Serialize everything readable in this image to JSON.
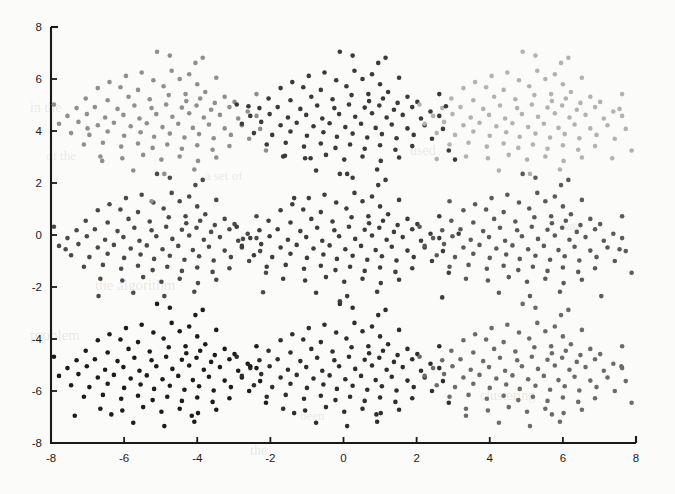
{
  "figure": {
    "width": 675,
    "height": 494,
    "background_color": "#fbfbf9",
    "axis_color": "#1a1a1a"
  },
  "chart_data": {
    "type": "scatter",
    "title": "",
    "xlabel": "",
    "ylabel": "",
    "xlim": [
      -8,
      8
    ],
    "ylim": [
      -8,
      8
    ],
    "xticks": [
      -8,
      -6,
      -4,
      -2,
      0,
      2,
      4,
      6,
      8
    ],
    "yticks": [
      -8,
      -6,
      -4,
      -2,
      0,
      2,
      4,
      6,
      8
    ],
    "xtick_labels": [
      "-8",
      "-6",
      "-4",
      "-2",
      "0",
      "2",
      "4",
      "6",
      "8"
    ],
    "ytick_labels": [
      "-8",
      "-6",
      "-4",
      "-2",
      "0",
      "2",
      "4",
      "6",
      "8"
    ],
    "grid": false,
    "legend": null,
    "marker": "filled-circle",
    "marker_size_px": 4.6,
    "n_clusters": 9,
    "points_per_cluster": 100,
    "total_points": 900,
    "cluster_grid": {
      "centers_x": [
        -5.0,
        0.0,
        5.0
      ],
      "centers_y": [
        4.7,
        0.0,
        -5.0
      ],
      "note": "3x3 grid of identical translated Gaussian-like blobs"
    },
    "clusters": [
      {
        "id": "top-left",
        "center": [
          -5.0,
          4.7
        ],
        "color": "#8f8f8f",
        "n": 100
      },
      {
        "id": "top-middle",
        "center": [
          0.0,
          4.7
        ],
        "color": "#3a3a3a",
        "n": 100
      },
      {
        "id": "top-right",
        "center": [
          5.0,
          4.7
        ],
        "color": "#b2b2b2",
        "n": 100
      },
      {
        "id": "middle-left",
        "center": [
          -5.0,
          0.0
        ],
        "color": "#4a4a4a",
        "n": 100
      },
      {
        "id": "middle-middle",
        "center": [
          0.0,
          0.0
        ],
        "color": "#3d3d3d",
        "n": 100
      },
      {
        "id": "middle-right",
        "center": [
          5.0,
          0.0
        ],
        "color": "#5a5a5a",
        "n": 100
      },
      {
        "id": "bottom-left",
        "center": [
          -5.0,
          -5.0
        ],
        "color": "#1c1c1c",
        "n": 100
      },
      {
        "id": "bottom-middle",
        "center": [
          0.0,
          -5.0
        ],
        "color": "#2e2e2e",
        "n": 100
      },
      {
        "id": "bottom-right",
        "center": [
          5.0,
          -5.0
        ],
        "color": "#6b6b6b",
        "n": 100
      }
    ],
    "cluster_offsets": [
      [
        -0.1,
        2.35
      ],
      [
        0.25,
        2.2
      ],
      [
        0.95,
        1.92
      ],
      [
        1.15,
        2.12
      ],
      [
        -0.52,
        1.55
      ],
      [
        -0.95,
        1.42
      ],
      [
        0.3,
        1.62
      ],
      [
        0.78,
        1.48
      ],
      [
        -1.4,
        1.18
      ],
      [
        -0.2,
        1.25
      ],
      [
        0.52,
        1.3
      ],
      [
        1.0,
        1.1
      ],
      [
        1.52,
        1.35
      ],
      [
        -1.72,
        0.95
      ],
      [
        -1.1,
        0.98
      ],
      [
        -0.62,
        0.88
      ],
      [
        0.08,
        1.02
      ],
      [
        0.68,
        0.72
      ],
      [
        1.22,
        0.8
      ],
      [
        1.75,
        0.62
      ],
      [
        -2.05,
        0.55
      ],
      [
        -1.45,
        0.48
      ],
      [
        -0.88,
        0.62
      ],
      [
        -0.3,
        0.52
      ],
      [
        0.22,
        0.68
      ],
      [
        0.7,
        0.45
      ],
      [
        1.08,
        0.55
      ],
      [
        1.48,
        0.38
      ],
      [
        2.02,
        0.42
      ],
      [
        -2.3,
        0.18
      ],
      [
        -1.8,
        0.22
      ],
      [
        -1.18,
        0.15
      ],
      [
        -0.72,
        0.28
      ],
      [
        -0.25,
        0.18
      ],
      [
        0.15,
        0.32
      ],
      [
        0.58,
        0.2
      ],
      [
        0.98,
        0.28
      ],
      [
        1.38,
        0.12
      ],
      [
        1.88,
        0.22
      ],
      [
        2.38,
        0.05
      ],
      [
        -2.55,
        -0.12
      ],
      [
        -2.02,
        -0.05
      ],
      [
        -1.52,
        -0.18
      ],
      [
        -1.02,
        -0.08
      ],
      [
        -0.58,
        -0.22
      ],
      [
        -0.12,
        -0.05
      ],
      [
        0.32,
        -0.15
      ],
      [
        0.78,
        -0.02
      ],
      [
        1.18,
        -0.18
      ],
      [
        1.62,
        -0.08
      ],
      [
        2.12,
        -0.22
      ],
      [
        2.62,
        -0.12
      ],
      [
        -2.78,
        -0.42
      ],
      [
        -2.25,
        -0.35
      ],
      [
        -1.72,
        -0.48
      ],
      [
        -1.28,
        -0.38
      ],
      [
        -0.82,
        -0.52
      ],
      [
        -0.38,
        -0.4
      ],
      [
        0.05,
        -0.55
      ],
      [
        0.48,
        -0.42
      ],
      [
        0.88,
        -0.58
      ],
      [
        1.32,
        -0.45
      ],
      [
        1.75,
        -0.6
      ],
      [
        2.22,
        -0.48
      ],
      [
        2.72,
        -0.62
      ],
      [
        -2.45,
        -0.78
      ],
      [
        -1.95,
        -0.85
      ],
      [
        -1.45,
        -0.72
      ],
      [
        -1.0,
        -0.88
      ],
      [
        -0.55,
        -0.75
      ],
      [
        -0.18,
        -0.92
      ],
      [
        0.25,
        -0.8
      ],
      [
        0.65,
        -0.95
      ],
      [
        1.05,
        -0.82
      ],
      [
        1.45,
        -0.98
      ],
      [
        1.92,
        -0.85
      ],
      [
        2.42,
        -1.0
      ],
      [
        -2.1,
        -1.22
      ],
      [
        -1.58,
        -1.15
      ],
      [
        -1.08,
        -1.3
      ],
      [
        -0.62,
        -1.18
      ],
      [
        -0.22,
        -1.35
      ],
      [
        0.18,
        -1.22
      ],
      [
        0.58,
        -1.38
      ],
      [
        1.0,
        -1.25
      ],
      [
        1.42,
        -1.42
      ],
      [
        1.88,
        -1.28
      ],
      [
        -1.65,
        -1.68
      ],
      [
        -1.05,
        -1.75
      ],
      [
        -0.48,
        -1.62
      ],
      [
        0.02,
        -1.8
      ],
      [
        0.52,
        -1.68
      ],
      [
        1.02,
        -1.85
      ],
      [
        1.52,
        -1.72
      ],
      [
        -0.75,
        -2.22
      ],
      [
        0.1,
        -2.35
      ],
      [
        0.92,
        -2.18
      ],
      [
        2.62,
        0.72
      ],
      [
        -2.92,
        0.32
      ],
      [
        2.88,
        -1.45
      ]
    ],
    "outliers": [
      {
        "x": -7.0,
        "y": 4.1,
        "cluster": "top-left"
      },
      {
        "x": -6.6,
        "y": 2.85,
        "cluster": "top-left"
      },
      {
        "x": -5.25,
        "y": 1.3,
        "cluster": "top-left"
      },
      {
        "x": -2.6,
        "y": 4.95,
        "cluster": "top-middle"
      },
      {
        "x": -1.6,
        "y": 3.05,
        "cluster": "top-middle"
      },
      {
        "x": -0.9,
        "y": 2.95,
        "cluster": "top-middle"
      },
      {
        "x": 2.8,
        "y": 4.95,
        "cluster": "top-middle"
      },
      {
        "x": 3.05,
        "y": 2.9,
        "cluster": "top-middle"
      },
      {
        "x": 7.55,
        "y": 4.85,
        "cluster": "top-right"
      },
      {
        "x": 2.55,
        "y": 2.92,
        "cluster": "top-right"
      },
      {
        "x": 7.35,
        "y": 2.95,
        "cluster": "top-right"
      },
      {
        "x": -7.6,
        "y": -0.55,
        "cluster": "middle-left"
      },
      {
        "x": -6.7,
        "y": -2.35,
        "cluster": "middle-left"
      },
      {
        "x": -2.75,
        "y": -0.15,
        "cluster": "middle-left"
      },
      {
        "x": -2.2,
        "y": -2.2,
        "cluster": "middle-left"
      },
      {
        "x": -1.35,
        "y": 1.42,
        "cluster": "middle-middle"
      },
      {
        "x": 3.15,
        "y": 0.05,
        "cluster": "middle-middle"
      },
      {
        "x": 2.7,
        "y": -2.4,
        "cluster": "middle-middle"
      },
      {
        "x": -0.1,
        "y": -2.55,
        "cluster": "middle-middle"
      },
      {
        "x": 7.55,
        "y": -0.55,
        "cluster": "middle-right"
      },
      {
        "x": 2.9,
        "y": 1.3,
        "cluster": "middle-right"
      },
      {
        "x": 7.05,
        "y": -2.35,
        "cluster": "middle-right"
      },
      {
        "x": -7.35,
        "y": -6.95,
        "cluster": "bottom-left"
      },
      {
        "x": -6.35,
        "y": -6.9,
        "cluster": "bottom-left"
      },
      {
        "x": -4.15,
        "y": -6.95,
        "cluster": "bottom-left"
      },
      {
        "x": -2.55,
        "y": -5.05,
        "cluster": "bottom-left"
      },
      {
        "x": -1.35,
        "y": -6.85,
        "cluster": "bottom-middle"
      },
      {
        "x": 0.9,
        "y": -6.9,
        "cluster": "bottom-middle"
      },
      {
        "x": 3.35,
        "y": -6.95,
        "cluster": "bottom-right"
      },
      {
        "x": 5.7,
        "y": -6.9,
        "cluster": "bottom-right"
      },
      {
        "x": 7.6,
        "y": -5.05,
        "cluster": "bottom-right"
      }
    ]
  },
  "bleed_through": [
    {
      "text": "in the",
      "x": 30,
      "y": 112,
      "size": 14,
      "rot": 0
    },
    {
      "text": "of the",
      "x": 46,
      "y": 160,
      "size": 13,
      "rot": 0
    },
    {
      "text": "the algorithm",
      "x": 95,
      "y": 290,
      "size": 15,
      "rot": 0
    },
    {
      "text": "a set of",
      "x": 205,
      "y": 180,
      "size": 13,
      "rot": 0
    },
    {
      "text": "used",
      "x": 410,
      "y": 155,
      "size": 14,
      "rot": 0
    },
    {
      "text": "the",
      "x": 250,
      "y": 455,
      "size": 14,
      "rot": 0
    },
    {
      "text": "been",
      "x": 300,
      "y": 420,
      "size": 13,
      "rot": 0
    },
    {
      "text": "problem",
      "x": 30,
      "y": 340,
      "size": 15,
      "rot": 0
    },
    {
      "text": "clustering",
      "x": 480,
      "y": 400,
      "size": 14,
      "rot": 0
    },
    {
      "text": "data",
      "x": 560,
      "y": 230,
      "size": 13,
      "rot": 0
    }
  ]
}
